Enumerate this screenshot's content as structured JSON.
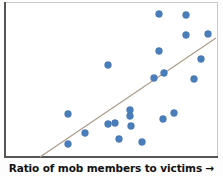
{
  "figure": {
    "width": 223,
    "height": 176,
    "background_color": "#ffffff"
  },
  "axis_label": {
    "text": "Ratio of mob members to victims",
    "arrow": "→"
  },
  "style": {
    "point_color": "#4a7ebb",
    "point_edge_color": "#3f6fa8",
    "trendline_color": "#a89a86",
    "axis_color": "#555558",
    "frame_color": "#c9c9c9",
    "label_color": "#111111"
  },
  "chart_data": {
    "type": "scatter",
    "title": "",
    "subtitle": "",
    "xlabel": "Ratio of mob members to victims →",
    "ylabel": "",
    "grid": false,
    "legend": false,
    "xlim": [
      0,
      223
    ],
    "ylim": [
      0,
      157
    ],
    "axis_ticks": {
      "x_tick_labels": [],
      "y_tick_labels": []
    },
    "note": "Positive correlation scatter; pixel coordinates with y measured downward from the top of the plot frame.",
    "point_radius": 3.4,
    "points": [
      {
        "x": 108,
        "y": 65
      },
      {
        "x": 159,
        "y": 14
      },
      {
        "x": 186,
        "y": 15
      },
      {
        "x": 186,
        "y": 35
      },
      {
        "x": 208,
        "y": 34
      },
      {
        "x": 159,
        "y": 51
      },
      {
        "x": 201,
        "y": 59
      },
      {
        "x": 154,
        "y": 78
      },
      {
        "x": 164,
        "y": 73
      },
      {
        "x": 194,
        "y": 79
      },
      {
        "x": 68,
        "y": 114
      },
      {
        "x": 85,
        "y": 133
      },
      {
        "x": 68,
        "y": 144
      },
      {
        "x": 108,
        "y": 124
      },
      {
        "x": 115,
        "y": 123
      },
      {
        "x": 130,
        "y": 110
      },
      {
        "x": 130,
        "y": 116
      },
      {
        "x": 131,
        "y": 126
      },
      {
        "x": 119,
        "y": 139
      },
      {
        "x": 142,
        "y": 142
      },
      {
        "x": 163,
        "y": 119
      },
      {
        "x": 174,
        "y": 113
      }
    ],
    "trendline": {
      "type": "linear",
      "x_start": 40,
      "y_start": 157,
      "x_end": 216,
      "y_end": 38,
      "color": "#a89a86",
      "width": 1.1
    }
  }
}
